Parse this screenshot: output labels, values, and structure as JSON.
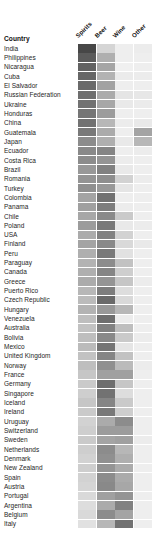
{
  "header": {
    "country_label": "Country",
    "columns": [
      "Spirits",
      "Beer",
      "Wine",
      "Other"
    ]
  },
  "chart_data": {
    "type": "heatmap",
    "title": "",
    "xlabel": "",
    "ylabel": "Country",
    "colormap": "greys",
    "value_range": [
      0,
      1
    ],
    "note": "Relative share of alcohol consumption by beverage type per country; darker = higher share",
    "categories": [
      "Spirits",
      "Beer",
      "Wine",
      "Other"
    ],
    "rows": [
      {
        "country": "India",
        "values": [
          0.92,
          0.18,
          0.05,
          0.06
        ]
      },
      {
        "country": "Philippines",
        "values": [
          0.82,
          0.38,
          0.05,
          0.05
        ]
      },
      {
        "country": "Nicaragua",
        "values": [
          0.78,
          0.43,
          0.04,
          0.05
        ]
      },
      {
        "country": "Cuba",
        "values": [
          0.76,
          0.36,
          0.07,
          0.06
        ]
      },
      {
        "country": "El Salvador",
        "values": [
          0.74,
          0.45,
          0.05,
          0.05
        ]
      },
      {
        "country": "Russian Federation",
        "values": [
          0.72,
          0.4,
          0.1,
          0.09
        ]
      },
      {
        "country": "Ukraine",
        "values": [
          0.7,
          0.42,
          0.08,
          0.07
        ]
      },
      {
        "country": "Honduras",
        "values": [
          0.68,
          0.48,
          0.05,
          0.05
        ]
      },
      {
        "country": "China",
        "values": [
          0.7,
          0.34,
          0.06,
          0.08
        ]
      },
      {
        "country": "Guatemala",
        "values": [
          0.66,
          0.4,
          0.05,
          0.44
        ]
      },
      {
        "country": "Japan",
        "values": [
          0.56,
          0.38,
          0.08,
          0.34
        ]
      },
      {
        "country": "Ecuador",
        "values": [
          0.58,
          0.6,
          0.05,
          0.06
        ]
      },
      {
        "country": "Costa Rica",
        "values": [
          0.56,
          0.52,
          0.06,
          0.05
        ]
      },
      {
        "country": "Brazil",
        "values": [
          0.5,
          0.62,
          0.08,
          0.05
        ]
      },
      {
        "country": "Romania",
        "values": [
          0.52,
          0.55,
          0.2,
          0.06
        ]
      },
      {
        "country": "Turkey",
        "values": [
          0.54,
          0.5,
          0.1,
          0.05
        ]
      },
      {
        "country": "Colombia",
        "values": [
          0.44,
          0.7,
          0.05,
          0.05
        ]
      },
      {
        "country": "Panama",
        "values": [
          0.46,
          0.64,
          0.06,
          0.05
        ]
      },
      {
        "country": "Chile",
        "values": [
          0.42,
          0.58,
          0.24,
          0.05
        ]
      },
      {
        "country": "Poland",
        "values": [
          0.48,
          0.66,
          0.08,
          0.06
        ]
      },
      {
        "country": "USA",
        "values": [
          0.4,
          0.62,
          0.2,
          0.05
        ]
      },
      {
        "country": "Finland",
        "values": [
          0.44,
          0.58,
          0.16,
          0.08
        ]
      },
      {
        "country": "Peru",
        "values": [
          0.38,
          0.66,
          0.12,
          0.05
        ]
      },
      {
        "country": "Paraguay",
        "values": [
          0.36,
          0.56,
          0.28,
          0.05
        ]
      },
      {
        "country": "Canada",
        "values": [
          0.38,
          0.6,
          0.22,
          0.05
        ]
      },
      {
        "country": "Greece",
        "values": [
          0.4,
          0.52,
          0.26,
          0.06
        ]
      },
      {
        "country": "Puerto Rico",
        "values": [
          0.34,
          0.64,
          0.14,
          0.05
        ]
      },
      {
        "country": "Czech Republic",
        "values": [
          0.32,
          0.74,
          0.16,
          0.05
        ]
      },
      {
        "country": "Hungary",
        "values": [
          0.36,
          0.5,
          0.34,
          0.05
        ]
      },
      {
        "country": "Venezuela",
        "values": [
          0.3,
          0.72,
          0.06,
          0.05
        ]
      },
      {
        "country": "Australia",
        "values": [
          0.28,
          0.62,
          0.3,
          0.05
        ]
      },
      {
        "country": "Bolivia",
        "values": [
          0.3,
          0.58,
          0.24,
          0.06
        ]
      },
      {
        "country": "Mexico",
        "values": [
          0.32,
          0.68,
          0.1,
          0.05
        ]
      },
      {
        "country": "United Kingdom",
        "values": [
          0.28,
          0.6,
          0.28,
          0.05
        ]
      },
      {
        "country": "Norway",
        "values": [
          0.3,
          0.54,
          0.32,
          0.06
        ]
      },
      {
        "country": "France",
        "values": [
          0.26,
          0.46,
          0.46,
          0.05
        ]
      },
      {
        "country": "Germany",
        "values": [
          0.24,
          0.72,
          0.26,
          0.05
        ]
      },
      {
        "country": "Singapore",
        "values": [
          0.22,
          0.7,
          0.14,
          0.05
        ]
      },
      {
        "country": "Iceland",
        "values": [
          0.26,
          0.6,
          0.24,
          0.05
        ]
      },
      {
        "country": "Ireland",
        "values": [
          0.24,
          0.66,
          0.22,
          0.05
        ]
      },
      {
        "country": "Uruguay",
        "values": [
          0.2,
          0.4,
          0.56,
          0.05
        ]
      },
      {
        "country": "Switzerland",
        "values": [
          0.22,
          0.48,
          0.48,
          0.05
        ]
      },
      {
        "country": "Sweden",
        "values": [
          0.24,
          0.44,
          0.46,
          0.06
        ]
      },
      {
        "country": "Netherlands",
        "values": [
          0.22,
          0.56,
          0.34,
          0.05
        ]
      },
      {
        "country": "Denmark",
        "values": [
          0.2,
          0.54,
          0.38,
          0.05
        ]
      },
      {
        "country": "New Zealand",
        "values": [
          0.22,
          0.52,
          0.4,
          0.05
        ]
      },
      {
        "country": "Spain",
        "values": [
          0.2,
          0.56,
          0.4,
          0.05
        ]
      },
      {
        "country": "Austria",
        "values": [
          0.18,
          0.58,
          0.42,
          0.05
        ]
      },
      {
        "country": "Portugal",
        "values": [
          0.16,
          0.46,
          0.52,
          0.05
        ]
      },
      {
        "country": "Argentina",
        "values": [
          0.14,
          0.4,
          0.62,
          0.05
        ]
      },
      {
        "country": "Belgium",
        "values": [
          0.16,
          0.56,
          0.44,
          0.05
        ]
      },
      {
        "country": "Italy",
        "values": [
          0.12,
          0.34,
          0.7,
          0.05
        ]
      }
    ]
  }
}
